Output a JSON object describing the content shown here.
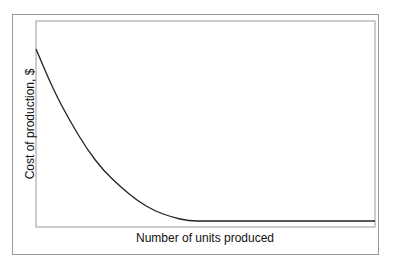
{
  "chart_data": {
    "type": "line",
    "title": "",
    "xlabel": "Number of units produced",
    "ylabel": "Cost of production, $",
    "x_ticks": [],
    "y_ticks": [],
    "grid": false,
    "legend": null,
    "series": [
      {
        "name": "Cost curve",
        "description": "Cost of production decreases steeply, then levels off to a flat minimum",
        "x": [
          0,
          0.05,
          0.1,
          0.15,
          0.2,
          0.25,
          0.3,
          0.35,
          0.4,
          0.45,
          0.5,
          0.6,
          0.7,
          0.8,
          0.9,
          1.0
        ],
        "y": [
          0.86,
          0.66,
          0.5,
          0.36,
          0.25,
          0.17,
          0.1,
          0.05,
          0.02,
          0.0,
          0.0,
          0.0,
          0.0,
          0.0,
          0.0,
          0.0
        ]
      }
    ],
    "xlim": [
      0,
      1
    ],
    "ylim": [
      0,
      1
    ]
  },
  "colors": {
    "line": "#222222",
    "axes": "#9a9a9a",
    "frame": "#9a9a9a"
  }
}
